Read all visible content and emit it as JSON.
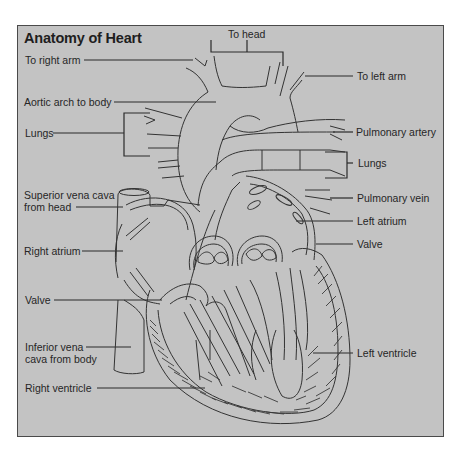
{
  "diagram": {
    "title": "Anatomy of Heart",
    "labels": {
      "to_head": "To head",
      "to_right_arm": "To right arm",
      "to_left_arm": "To left arm",
      "aortic_arch": "Aortic arch to body",
      "lungs_left": "Lungs",
      "pulmonary_artery": "Pulmonary artery",
      "lungs_right": "Lungs",
      "superior_vena_cava_line1": "Superior vena cava",
      "superior_vena_cava_line2": "from head",
      "pulmonary_vein": "Pulmonary vein",
      "left_atrium": "Left atrium",
      "right_atrium": "Right atrium",
      "valve_right": "Valve",
      "valve_left": "Valve",
      "inferior_vena_cava_line1": "Inferior vena",
      "inferior_vena_cava_line2": "cava from body",
      "left_ventricle": "Left ventricle",
      "right_ventricle": "Right ventricle"
    },
    "colors": {
      "panel_background": "#c3c3c3",
      "line": "#2a2a2a",
      "border": "#4a4a4a"
    }
  }
}
